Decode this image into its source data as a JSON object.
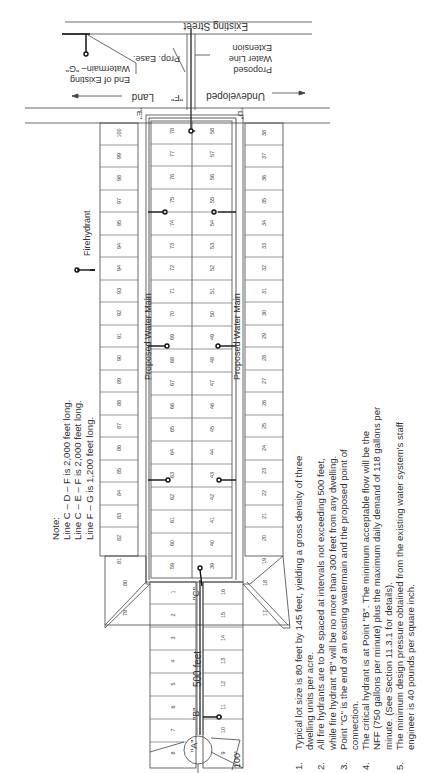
{
  "labels": {
    "existing_street": "Existing Street",
    "prop_ease": "Prop. Ease.",
    "proposed_extension": [
      "Proposed",
      "Water Line",
      "Extension"
    ],
    "end_existing": [
      "End of Existing",
      "Watermain– \"G\""
    ],
    "land": "Land",
    "undeveloped": "Undeveloped",
    "point_f": "\"F\"",
    "point_e": "\"E\"",
    "point_d": "\"D\"",
    "point_c": "\"C\"",
    "point_b": "\"B\"",
    "point_a": "\"A\"",
    "dim_500": "500 feet",
    "dim_100": "100'",
    "water_main_left": "Proposed Water Main",
    "water_main_right": "Proposed Water Main",
    "firehydrant": "Firehydrant"
  },
  "line_note": {
    "title": "Note:",
    "lines": [
      "Line C – D – F is 2,000 feet long.",
      "Line C – E – F is 2,000 feet long.",
      "Line F – G is 1,200 feet long."
    ]
  },
  "notes": [
    {
      "num": "1.",
      "lines": [
        "Typical lot size is 80 feet by 145 feet, yielding a gross density of three",
        "dwelling units per acre."
      ]
    },
    {
      "num": "2.",
      "lines": [
        "All fire hydrants are to be spaced at intervals not exceeding 500 feet,",
        "while fire hydrant \"B\" will be no more than 300 feet from any dwelling."
      ]
    },
    {
      "num": "3.",
      "lines": [
        "Point \"G\" is the end of an existing watermain and the proposed point of",
        "connection."
      ]
    },
    {
      "num": "4.",
      "lines": [
        "The critical hydrant is at Point \"B\".  The minimum acceptable flow will be the",
        "   NFF (750 gallons per minute) plus the maximum daily demand of 118 gallons per",
        "   minute.  (See Section 11.3.1 for details)."
      ]
    },
    {
      "num": "5.",
      "lines": [
        "The minimum design pressure obtained from the existing water system's staff",
        "engineer is 40 pounds per square inch."
      ]
    }
  ],
  "lots": {
    "left_column": [
      "100",
      "99",
      "98",
      "97",
      "95",
      "94",
      "94",
      "93",
      "92",
      "91",
      "90",
      "89",
      "88",
      "87",
      "86",
      "85",
      "84",
      "83",
      "82",
      "81"
    ],
    "inner_left": [
      "78",
      "77",
      "76",
      "75",
      "74",
      "73",
      "72",
      "71",
      "70",
      "69",
      "68",
      "67",
      "66",
      "65",
      "64",
      "63",
      "62",
      "61",
      "60",
      "59"
    ],
    "inner_right": [
      "58",
      "57",
      "56",
      "55",
      "54",
      "53",
      "52",
      "51",
      "50",
      "49",
      "48",
      "47",
      "46",
      "45",
      "44",
      "43",
      "42",
      "41",
      "40",
      "39"
    ],
    "right_column": [
      "38",
      "37",
      "36",
      "35",
      "34",
      "33",
      "32",
      "31",
      "30",
      "29",
      "28",
      "27",
      "26",
      "25",
      "24",
      "23",
      "22",
      "21",
      "20",
      "19"
    ],
    "corner_left": [
      "80",
      "79"
    ],
    "corner_right": [
      "18",
      "17"
    ],
    "stub_left": [
      "1",
      "2",
      "3",
      "4",
      "5",
      "6",
      "7",
      "8"
    ],
    "stub_right": [
      "16",
      "15",
      "14",
      "13",
      "12",
      "11",
      "10",
      "9"
    ]
  }
}
